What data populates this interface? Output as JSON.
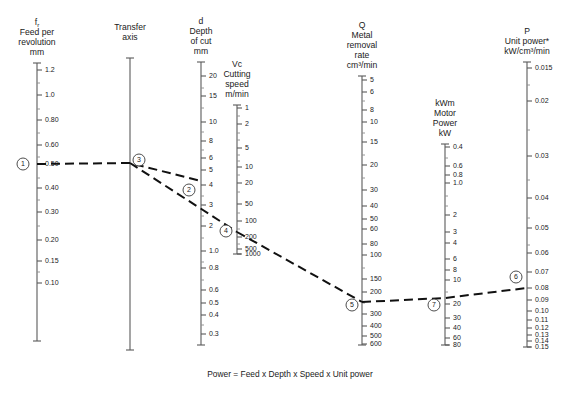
{
  "figure": {
    "title_footer": "Power = Feed x Depth x Speed x Unit power",
    "background": "#ffffff",
    "line_color": "#111111",
    "axis_color": "#5a5a5a"
  },
  "axes": [
    {
      "id": "feed",
      "symbol": "f",
      "symbol_sub": "r",
      "header_lines": [
        "Feed per",
        "revolution",
        "mm"
      ],
      "x": 37,
      "y_top": 63,
      "y_bottom": 341,
      "label_side": "right",
      "ticks": [
        {
          "label": "1.2",
          "y": 70
        },
        {
          "label": "",
          "y": 83
        },
        {
          "label": "1.0",
          "y": 95
        },
        {
          "label": "",
          "y": 109
        },
        {
          "label": "0.80",
          "y": 120
        },
        {
          "label": "",
          "y": 133
        },
        {
          "label": "0.60",
          "y": 145
        },
        {
          "label": "",
          "y": 157
        },
        {
          "label": "0.50",
          "y": 164
        },
        {
          "label": "",
          "y": 178
        },
        {
          "label": "0.40",
          "y": 188
        },
        {
          "label": "",
          "y": 200
        },
        {
          "label": "0.30",
          "y": 212
        },
        {
          "label": "",
          "y": 226
        },
        {
          "label": "0.20",
          "y": 240
        },
        {
          "label": "0.15",
          "y": 261
        },
        {
          "label": "",
          "y": 272
        },
        {
          "label": "0.10",
          "y": 283
        }
      ]
    },
    {
      "id": "transfer",
      "symbol": "",
      "symbol_sub": "",
      "header_lines": [
        "Transfer",
        "axis"
      ],
      "x": 130,
      "y_top": 58,
      "y_bottom": 350,
      "label_side": "right",
      "ticks": []
    },
    {
      "id": "depth",
      "symbol": "d",
      "symbol_sub": "",
      "header_lines": [
        "Depth",
        "of cut",
        "mm"
      ],
      "x": 201,
      "y_top": 62,
      "y_bottom": 345,
      "label_side": "right",
      "ticks": [
        {
          "label": "20",
          "y": 76
        },
        {
          "label": "",
          "y": 88
        },
        {
          "label": "15",
          "y": 96
        },
        {
          "label": "",
          "y": 108
        },
        {
          "label": "10",
          "y": 122
        },
        {
          "label": "",
          "y": 132
        },
        {
          "label": "8",
          "y": 141
        },
        {
          "label": "",
          "y": 150
        },
        {
          "label": "6",
          "y": 158
        },
        {
          "label": "5",
          "y": 170
        },
        {
          "label": "4",
          "y": 185
        },
        {
          "label": "",
          "y": 196
        },
        {
          "label": "3",
          "y": 205
        },
        {
          "label": "",
          "y": 216
        },
        {
          "label": "2",
          "y": 226
        },
        {
          "label": "",
          "y": 238
        },
        {
          "label": "1.0",
          "y": 251
        },
        {
          "label": "",
          "y": 262
        },
        {
          "label": "0.8",
          "y": 268
        },
        {
          "label": "",
          "y": 280
        },
        {
          "label": "0.6",
          "y": 290
        },
        {
          "label": "0.5",
          "y": 303
        },
        {
          "label": "0.4",
          "y": 315
        },
        {
          "label": "",
          "y": 325
        },
        {
          "label": "0.3",
          "y": 334
        }
      ]
    },
    {
      "id": "speed",
      "symbol": "Vc",
      "symbol_sub": "",
      "header_lines": [
        "Cutting",
        "speed",
        "m/min"
      ],
      "x": 237,
      "y_top": 105,
      "y_bottom": 254,
      "label_side": "right",
      "ticks": [
        {
          "label": "1",
          "y": 108
        },
        {
          "label": "",
          "y": 116
        },
        {
          "label": "2",
          "y": 124
        },
        {
          "label": "",
          "y": 133
        },
        {
          "label": "",
          "y": 140
        },
        {
          "label": "5",
          "y": 148
        },
        {
          "label": "",
          "y": 155
        },
        {
          "label": "",
          "y": 161
        },
        {
          "label": "10",
          "y": 167
        },
        {
          "label": "",
          "y": 175
        },
        {
          "label": "20",
          "y": 183
        },
        {
          "label": "",
          "y": 192
        },
        {
          "label": "50",
          "y": 204
        },
        {
          "label": "",
          "y": 213
        },
        {
          "label": "100",
          "y": 221
        },
        {
          "label": "",
          "y": 229
        },
        {
          "label": "200",
          "y": 237
        },
        {
          "label": "",
          "y": 244
        },
        {
          "label": "500",
          "y": 249
        },
        {
          "label": "1000",
          "y": 254
        }
      ]
    },
    {
      "id": "mrr",
      "symbol": "Q",
      "symbol_sub": "",
      "header_lines": [
        "Metal",
        "removal",
        "rate",
        "cm³/min"
      ],
      "x": 362,
      "y_top": 76,
      "y_bottom": 345,
      "label_side": "right",
      "ticks": [
        {
          "label": "5",
          "y": 80
        },
        {
          "label": "6",
          "y": 92
        },
        {
          "label": "",
          "y": 101
        },
        {
          "label": "8",
          "y": 110
        },
        {
          "label": "10",
          "y": 122
        },
        {
          "label": "",
          "y": 133
        },
        {
          "label": "15",
          "y": 142
        },
        {
          "label": "",
          "y": 155
        },
        {
          "label": "20",
          "y": 165
        },
        {
          "label": "",
          "y": 178
        },
        {
          "label": "30",
          "y": 190
        },
        {
          "label": "40",
          "y": 206
        },
        {
          "label": "50",
          "y": 219
        },
        {
          "label": "60",
          "y": 229
        },
        {
          "label": "80",
          "y": 244
        },
        {
          "label": "100",
          "y": 255
        },
        {
          "label": "",
          "y": 268
        },
        {
          "label": "150",
          "y": 279
        },
        {
          "label": "200",
          "y": 292
        },
        {
          "label": "",
          "y": 303
        },
        {
          "label": "300",
          "y": 314
        },
        {
          "label": "400",
          "y": 326
        },
        {
          "label": "500",
          "y": 336
        },
        {
          "label": "600",
          "y": 344
        }
      ]
    },
    {
      "id": "motor",
      "symbol": "kWm",
      "symbol_sub": "",
      "header_lines": [
        "Motor",
        "Power",
        "kW"
      ],
      "x": 445,
      "y_top": 144,
      "y_bottom": 345,
      "label_side": "right",
      "ticks": [
        {
          "label": "0.4",
          "y": 147
        },
        {
          "label": "",
          "y": 158
        },
        {
          "label": "0.6",
          "y": 166
        },
        {
          "label": "0.8",
          "y": 175
        },
        {
          "label": "1.0",
          "y": 183
        },
        {
          "label": "",
          "y": 196
        },
        {
          "label": "",
          "y": 206
        },
        {
          "label": "2",
          "y": 215
        },
        {
          "label": "3",
          "y": 232
        },
        {
          "label": "4",
          "y": 243
        },
        {
          "label": "6",
          "y": 259
        },
        {
          "label": "8",
          "y": 270
        },
        {
          "label": "10",
          "y": 280
        },
        {
          "label": "",
          "y": 292
        },
        {
          "label": "20",
          "y": 304
        },
        {
          "label": "30",
          "y": 318
        },
        {
          "label": "40",
          "y": 328
        },
        {
          "label": "60",
          "y": 338
        },
        {
          "label": "80",
          "y": 345
        }
      ]
    },
    {
      "id": "unitpower",
      "symbol": "P",
      "symbol_sub": "",
      "header_lines": [
        "Unit power*",
        "kW/cm³/min"
      ],
      "x": 527,
      "y_top": 62,
      "y_bottom": 347,
      "label_side": "right",
      "ticks": [
        {
          "label": "0.015",
          "y": 68
        },
        {
          "label": "",
          "y": 85
        },
        {
          "label": "0.02",
          "y": 101
        },
        {
          "label": "",
          "y": 130
        },
        {
          "label": "0.03",
          "y": 156
        },
        {
          "label": "",
          "y": 180
        },
        {
          "label": "0.04",
          "y": 198
        },
        {
          "label": "",
          "y": 218
        },
        {
          "label": "0.05",
          "y": 228
        },
        {
          "label": "",
          "y": 245
        },
        {
          "label": "0.06",
          "y": 253
        },
        {
          "label": "0.07",
          "y": 272
        },
        {
          "label": "0.08",
          "y": 288
        },
        {
          "label": "0.09",
          "y": 300
        },
        {
          "label": "0.10",
          "y": 311
        },
        {
          "label": "0.11",
          "y": 320
        },
        {
          "label": "0.12",
          "y": 328
        },
        {
          "label": "0.13",
          "y": 335
        },
        {
          "label": "0.14",
          "y": 341
        },
        {
          "label": "0.15",
          "y": 347
        }
      ]
    }
  ],
  "nodes": [
    {
      "id": "1",
      "label": "1",
      "x": 23,
      "y": 164,
      "axis": "feed",
      "value": "0.50"
    },
    {
      "id": "2",
      "label": "2",
      "x": 189,
      "y": 190,
      "axis": "depth",
      "value": "4"
    },
    {
      "id": "3",
      "label": "3",
      "x": 139,
      "y": 160,
      "axis": "transfer",
      "value": ""
    },
    {
      "id": "4",
      "label": "4",
      "x": 226,
      "y": 231,
      "axis": "speed",
      "value": "200"
    },
    {
      "id": "5",
      "label": "5",
      "x": 352,
      "y": 305,
      "axis": "mrr",
      "value": "270"
    },
    {
      "id": "6",
      "label": "6",
      "x": 516,
      "y": 277,
      "axis": "unitpower",
      "value": "0.08"
    },
    {
      "id": "7",
      "label": "7",
      "x": 434,
      "y": 305,
      "axis": "motor",
      "value": "20"
    }
  ],
  "isopleths": [
    {
      "id": "feed-to-depth",
      "points": [
        [
          37,
          164
        ],
        [
          130,
          163
        ],
        [
          201,
          181
        ]
      ]
    },
    {
      "id": "transfer-to-speed",
      "points": [
        [
          130,
          163
        ],
        [
          237,
          232
        ]
      ]
    },
    {
      "id": "speed-to-mrr",
      "points": [
        [
          237,
          232
        ],
        [
          362,
          302
        ]
      ]
    },
    {
      "id": "mrr-to-unitpower",
      "points": [
        [
          362,
          302
        ],
        [
          445,
          298
        ],
        [
          527,
          288
        ]
      ]
    }
  ]
}
